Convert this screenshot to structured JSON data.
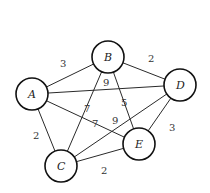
{
  "graph": {
    "nodes": [
      {
        "id": "A",
        "label": "A",
        "x": 32,
        "y": 94
      },
      {
        "id": "B",
        "label": "B",
        "x": 108,
        "y": 57
      },
      {
        "id": "C",
        "label": "C",
        "x": 61,
        "y": 166
      },
      {
        "id": "D",
        "label": "D",
        "x": 180,
        "y": 85
      },
      {
        "id": "E",
        "label": "E",
        "x": 139,
        "y": 144
      }
    ],
    "edges": [
      {
        "from": "A",
        "to": "B",
        "weight": "3"
      },
      {
        "from": "B",
        "to": "D",
        "weight": "2"
      },
      {
        "from": "A",
        "to": "D",
        "weight": "9"
      },
      {
        "from": "B",
        "to": "C",
        "weight": "7"
      },
      {
        "from": "B",
        "to": "E",
        "weight": "5"
      },
      {
        "from": "A",
        "to": "E",
        "weight": "7"
      },
      {
        "from": "C",
        "to": "D",
        "weight": "9"
      },
      {
        "from": "A",
        "to": "C",
        "weight": "2"
      },
      {
        "from": "D",
        "to": "E",
        "weight": "3"
      },
      {
        "from": "C",
        "to": "E",
        "weight": "2"
      }
    ]
  }
}
